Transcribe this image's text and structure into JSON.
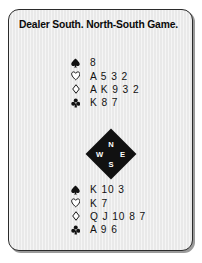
{
  "card": {
    "header": "Dealer South. North-South Game.",
    "background_color": "#e9e9e9",
    "border_color": "#2b2b2b",
    "text_color": "#111111"
  },
  "hands": {
    "north": {
      "position_label": "North",
      "suits": [
        {
          "icon": "spade-icon",
          "suit": "spades",
          "filled": true,
          "cards": "8"
        },
        {
          "icon": "heart-icon",
          "suit": "hearts",
          "filled": false,
          "cards": "A 5 3 2"
        },
        {
          "icon": "diamond-icon",
          "suit": "diamonds",
          "filled": false,
          "cards": "A K 9 3 2"
        },
        {
          "icon": "club-icon",
          "suit": "clubs",
          "filled": true,
          "cards": "K 8 7"
        }
      ]
    },
    "south": {
      "position_label": "South",
      "suits": [
        {
          "icon": "spade-icon",
          "suit": "spades",
          "filled": true,
          "cards": "K 10 3"
        },
        {
          "icon": "heart-icon",
          "suit": "hearts",
          "filled": false,
          "cards": "K 7"
        },
        {
          "icon": "diamond-icon",
          "suit": "diamonds",
          "filled": false,
          "cards": "Q J 10 8 7"
        },
        {
          "icon": "club-icon",
          "suit": "clubs",
          "filled": true,
          "cards": "A 9 6"
        }
      ]
    }
  },
  "compass": {
    "north": "N",
    "west": "W",
    "east": "E",
    "south": "S",
    "fill_color": "#111111",
    "label_color": "#ffffff"
  }
}
